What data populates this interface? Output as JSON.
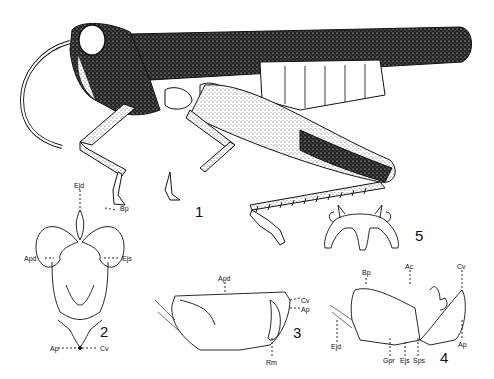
{
  "plate": {
    "figures": [
      {
        "number": "1",
        "subject": "grasshopper habitus, lateral view"
      },
      {
        "number": "2",
        "subject": "phallic complex, dorsal view",
        "labels": [
          "Ejd",
          "Bp",
          "Apd",
          "Ejs",
          "Ap",
          "Cv"
        ]
      },
      {
        "number": "3",
        "subject": "phallic complex, lateral view",
        "labels": [
          "Apd",
          "Cv",
          "Ap",
          "Rm"
        ]
      },
      {
        "number": "4",
        "subject": "phallic complex, lateral view (dissected)",
        "labels": [
          "Bp",
          "Ac",
          "Cv",
          "Ejd",
          "Ap",
          "Gpr",
          "Ejs",
          "Sps"
        ]
      },
      {
        "number": "5",
        "subject": "epiphallus"
      }
    ],
    "colors": {
      "ink": "#111111",
      "paper": "#ffffff"
    }
  },
  "fig1": {
    "num": "1"
  },
  "fig2": {
    "num": "2",
    "ejd": "Ejd",
    "bp": "Bp",
    "apd": "Apd",
    "ejs": "Ejs",
    "ap": "Ap",
    "cv": "Cv"
  },
  "fig3": {
    "num": "3",
    "apd": "Apd",
    "cv": "Cv",
    "ap": "Ap",
    "rm": "Rm"
  },
  "fig4": {
    "num": "4",
    "bp": "Bp",
    "ac": "Ac",
    "cv": "Cv",
    "ejd": "Ejd",
    "ap": "Ap",
    "gpr": "Gpr",
    "ejs": "Ejs",
    "sps": "Sps"
  },
  "fig5": {
    "num": "5"
  }
}
